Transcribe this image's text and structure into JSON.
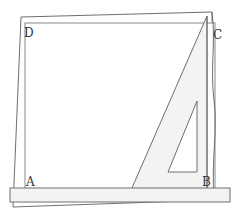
{
  "diagram": {
    "labels": {
      "A": "A",
      "B": "B",
      "C": "C",
      "D": "D"
    },
    "colors": {
      "stroke": "#6e6e6e",
      "paper": "#ffffff",
      "tool_fill": "#f3f3f3",
      "label": "#333333"
    }
  }
}
